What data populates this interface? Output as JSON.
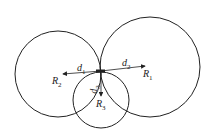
{
  "diagram": {
    "type": "three-circle contact diagram",
    "circles": [
      {
        "id": "R1",
        "cx": 150,
        "cy": 67,
        "r": 50
      },
      {
        "id": "R2",
        "cx": 58,
        "cy": 74,
        "r": 43
      },
      {
        "id": "R3",
        "cx": 101,
        "cy": 100,
        "r": 28
      }
    ],
    "contact_point": {
      "x": 101,
      "y": 71
    },
    "vectors": [
      {
        "label": "d",
        "sub": "1",
        "to": "R",
        "to_sub": "2"
      },
      {
        "label": "d",
        "sub": "2",
        "to": "R",
        "to_sub": "1"
      },
      {
        "label": "d",
        "sub": "3",
        "to": "R",
        "to_sub": "3"
      }
    ],
    "labels": {
      "d1": "d",
      "d1_sub": "1",
      "d2": "d",
      "d2_sub": "2",
      "d3": "d",
      "d3_sub": "3",
      "R1": "R",
      "R1_sub": "1",
      "R2": "R",
      "R2_sub": "2",
      "R3": "R",
      "R3_sub": "3"
    },
    "stroke_color": "#222222"
  }
}
